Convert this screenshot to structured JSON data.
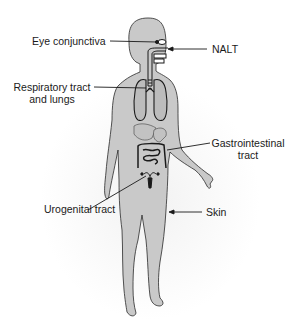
{
  "diagram": {
    "type": "anatomical-body-diagram",
    "colors": {
      "body_fill": "#c9c9c9",
      "body_outline": "#2a2a2a",
      "organ_outline": "#1a1a1a",
      "leader_line": "#1a1a1a",
      "background": "#ffffff"
    },
    "labels": {
      "eye": "Eye conjunctiva",
      "nalt": "NALT",
      "respiratory_line1": "Respiratory tract",
      "respiratory_line2": "and lungs",
      "gi_line1": "Gastrointestinal",
      "gi_line2": "tract",
      "urogenital": "Urogenital tract",
      "skin": "Skin"
    }
  }
}
